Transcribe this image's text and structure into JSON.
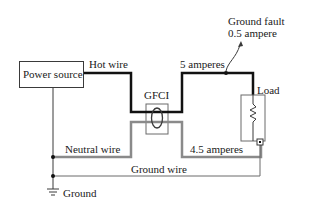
{
  "diagram": {
    "components": {
      "power_source": "Power source",
      "gfci": "GFCI",
      "load": "Load",
      "ground": "Ground"
    },
    "wires": {
      "hot": "Hot wire",
      "neutral": "Neutral wire",
      "ground": "Ground wire"
    },
    "annotations": {
      "hot_current": "5 amperes",
      "neutral_current": "4.5 amperes",
      "fault_line1": "Ground fault",
      "fault_line2": "0.5 ampere"
    },
    "colors": {
      "hot_wire": "#111111",
      "neutral_wire": "#8a8a8a",
      "ground_wire": "#6a6a6a",
      "outline": "#3a3a3a"
    }
  }
}
